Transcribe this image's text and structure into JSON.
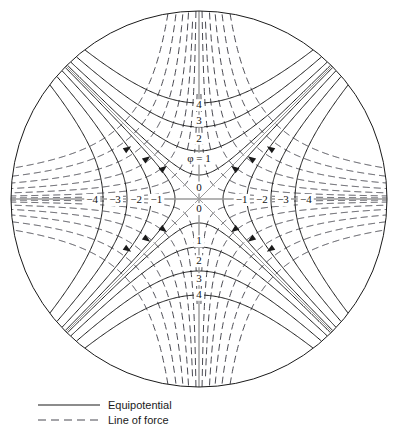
{
  "figure": {
    "name": "quadrupole-saddle-field-diagram",
    "geometry": {
      "center_x": 199,
      "center_y": 199,
      "radius": 189,
      "unit_px": 24
    },
    "colors": {
      "equipotential": "#1a1a1a",
      "line_of_force": "#4a4a52",
      "axis": "#9a9a9a",
      "boundary": "#1a1a1a",
      "background": "#ffffff"
    }
  },
  "labels": {
    "top": [
      "4",
      "3",
      "2"
    ],
    "phi_label": "φ = 1",
    "center_upper": "0",
    "center_lower": "0",
    "bottom": [
      "1",
      "2",
      "3",
      "4"
    ],
    "left": [
      "−4",
      "−3",
      "−2",
      "−1"
    ],
    "right": [
      "−1",
      "−2",
      "−3",
      "−4"
    ]
  },
  "legend": {
    "items": [
      {
        "style": "solid",
        "label": "Equipotential"
      },
      {
        "style": "dashed",
        "label": "Line of force"
      }
    ]
  },
  "chart_data": {
    "type": "line",
    "title": "",
    "xlabel": "",
    "ylabel": "",
    "equipotential_levels_vertical": [
      1,
      2,
      3,
      4
    ],
    "equipotential_levels_horizontal": [
      -1,
      -2,
      -3,
      -4
    ],
    "force_line_constants": [
      0.35,
      1.0,
      2.0,
      3.4,
      5.2,
      7.4,
      10.0
    ],
    "equation_equipotential": "y^2 - x^2 = k^2",
    "equation_line_of_force": "x*y = c",
    "asymptote_angles_deg": [
      45,
      135,
      225,
      315
    ],
    "arrow_count": 12,
    "grid": false,
    "legend_position": "bottom-left"
  }
}
